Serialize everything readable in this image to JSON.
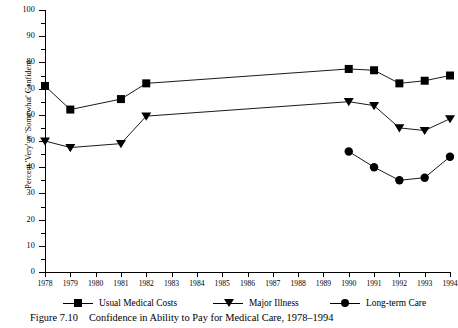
{
  "caption": {
    "number": "Figure 7.10",
    "text": "Confidence in Ability to Pay for Medical Care, 1978–1994"
  },
  "axes": {
    "y_title": "Percent 'Very' or 'Somewhat' Confident",
    "y_ticks": [
      "0",
      "10",
      "20",
      "30",
      "40",
      "50",
      "60",
      "70",
      "80",
      "90",
      "100"
    ],
    "x_ticks": [
      "1978",
      "1979",
      "1980",
      "1981",
      "1982",
      "1983",
      "1984",
      "1985",
      "1986",
      "1987",
      "1988",
      "1989",
      "1990",
      "1991",
      "1992",
      "1993",
      "1994"
    ]
  },
  "legend": [
    {
      "label": "Usual Medical Costs",
      "marker": "square-marker-icon"
    },
    {
      "label": "Major Illness",
      "marker": "triangle-marker-icon"
    },
    {
      "label": "Long-term Care",
      "marker": "circle-marker-icon"
    }
  ],
  "chart_data": {
    "type": "line",
    "title": "Confidence in Ability to Pay for Medical Care, 1978–1994",
    "xlabel": "",
    "ylabel": "Percent 'Very' or 'Somewhat' Confident",
    "ylim": [
      0,
      100
    ],
    "ytick_step": 10,
    "yminor_step": 5,
    "xlim": [
      1978,
      1994
    ],
    "grid": false,
    "legend_position": "bottom",
    "x": [
      1978,
      1979,
      1980,
      1981,
      1982,
      1983,
      1984,
      1985,
      1986,
      1987,
      1988,
      1989,
      1990,
      1991,
      1992,
      1993,
      1994
    ],
    "series": [
      {
        "name": "Usual Medical Costs",
        "marker": "square",
        "points": [
          {
            "x": 1978,
            "y": 71
          },
          {
            "x": 1979,
            "y": 62
          },
          {
            "x": 1981,
            "y": 66
          },
          {
            "x": 1982,
            "y": 72
          },
          {
            "x": 1990,
            "y": 77.5
          },
          {
            "x": 1991,
            "y": 77
          },
          {
            "x": 1992,
            "y": 72
          },
          {
            "x": 1993,
            "y": 73
          },
          {
            "x": 1994,
            "y": 75
          }
        ]
      },
      {
        "name": "Major Illness",
        "marker": "triangle",
        "points": [
          {
            "x": 1978,
            "y": 50
          },
          {
            "x": 1979,
            "y": 47.5
          },
          {
            "x": 1981,
            "y": 49
          },
          {
            "x": 1982,
            "y": 59.5
          },
          {
            "x": 1990,
            "y": 65
          },
          {
            "x": 1991,
            "y": 63.5
          },
          {
            "x": 1992,
            "y": 55
          },
          {
            "x": 1993,
            "y": 54
          },
          {
            "x": 1994,
            "y": 58.5
          }
        ]
      },
      {
        "name": "Long-term Care",
        "marker": "circle",
        "points": [
          {
            "x": 1990,
            "y": 46
          },
          {
            "x": 1991,
            "y": 40
          },
          {
            "x": 1992,
            "y": 35
          },
          {
            "x": 1993,
            "y": 36
          },
          {
            "x": 1994,
            "y": 44
          }
        ]
      }
    ]
  },
  "colors": {
    "ink": "#000000",
    "background": "#ffffff"
  }
}
